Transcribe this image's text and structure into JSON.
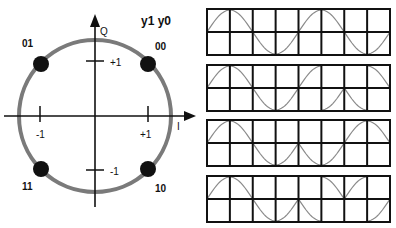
{
  "constellation": {
    "title": "y1 y0",
    "axis_q_label": "Q",
    "axis_i_label": "I",
    "ticks": {
      "i_pos": "+1",
      "i_neg": "-1",
      "q_pos": "+1",
      "q_neg": "-1"
    },
    "points": [
      {
        "label": "00",
        "i": 1,
        "q": 1
      },
      {
        "label": "01",
        "i": -1,
        "q": 1
      },
      {
        "label": "11",
        "i": -1,
        "q": -1
      },
      {
        "label": "10",
        "i": 1,
        "q": -1
      }
    ],
    "colors": {
      "circle": "#7a7a7a",
      "dot": "#111111",
      "axis": "#111111"
    }
  },
  "waveforms": {
    "description": "QPSK waveforms, 8 cells each (4 symbols x 2 cells)",
    "rows": [
      {
        "segments": [
          "up",
          "up",
          "down",
          "down",
          "up",
          "up",
          "down",
          "down"
        ]
      },
      {
        "segments": [
          "up",
          "up",
          "down",
          "down",
          "up",
          "down",
          "down",
          "up"
        ]
      },
      {
        "segments": [
          "up",
          "up",
          "down",
          "down",
          "down",
          "down",
          "up",
          "up"
        ]
      },
      {
        "segments": [
          "up",
          "up",
          "down",
          "down",
          "down",
          "up",
          "up",
          "down"
        ]
      }
    ],
    "colors": {
      "grid": "#111111",
      "curve": "#8a8a8a"
    }
  }
}
